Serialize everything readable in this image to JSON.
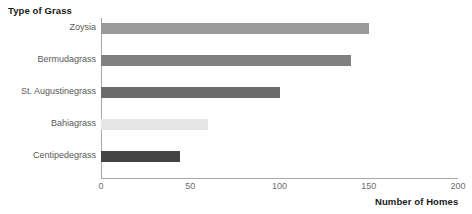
{
  "chart_data": {
    "type": "bar",
    "orientation": "horizontal",
    "title": "",
    "xlabel": "Number of Homes",
    "ylabel": "Type of Grass",
    "categories": [
      "Zoysia",
      "Bermudagrass",
      "St. Augustinegrass",
      "Bahiagrass",
      "Centipedegrass"
    ],
    "values": [
      150,
      140,
      100,
      60,
      44
    ],
    "bar_colors": [
      "#999999",
      "#808080",
      "#6b6b6b",
      "#e6e6e6",
      "#444444"
    ],
    "xlim": [
      0,
      200
    ],
    "xticks": [
      0,
      50,
      100,
      150,
      200
    ],
    "xtick_labels": [
      "0",
      "50",
      "100",
      "150",
      "200"
    ],
    "grid": false,
    "legend": false
  },
  "axis": {
    "y_title": "Type of Grass",
    "x_title": "Number of Homes"
  }
}
